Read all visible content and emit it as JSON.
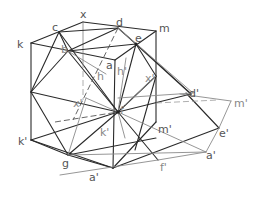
{
  "diagram": {
    "title": "",
    "labels": {
      "x": "x",
      "c": "c",
      "d": "d",
      "m": "m",
      "k": "k",
      "b": "b",
      "e": "e",
      "a": "a",
      "h": "h",
      "h_prime": "h'",
      "x_prime_left": "x'",
      "x_prime_right": "x'",
      "d_prime": "d'",
      "m_prime_right": "m'",
      "f": "f",
      "k_prime_inner": "k'",
      "m_prime_inner": "m'",
      "k_prime": "k'",
      "g": "g",
      "e_prime": "e'",
      "a_prime_bottom": "a'",
      "a_prime_right": "a'",
      "f_prime": "f'"
    },
    "colors": {
      "line_dark": "#2a2a2a",
      "line_gray": "#8a8a8a",
      "label": "#555555",
      "background": "#ffffff"
    }
  }
}
